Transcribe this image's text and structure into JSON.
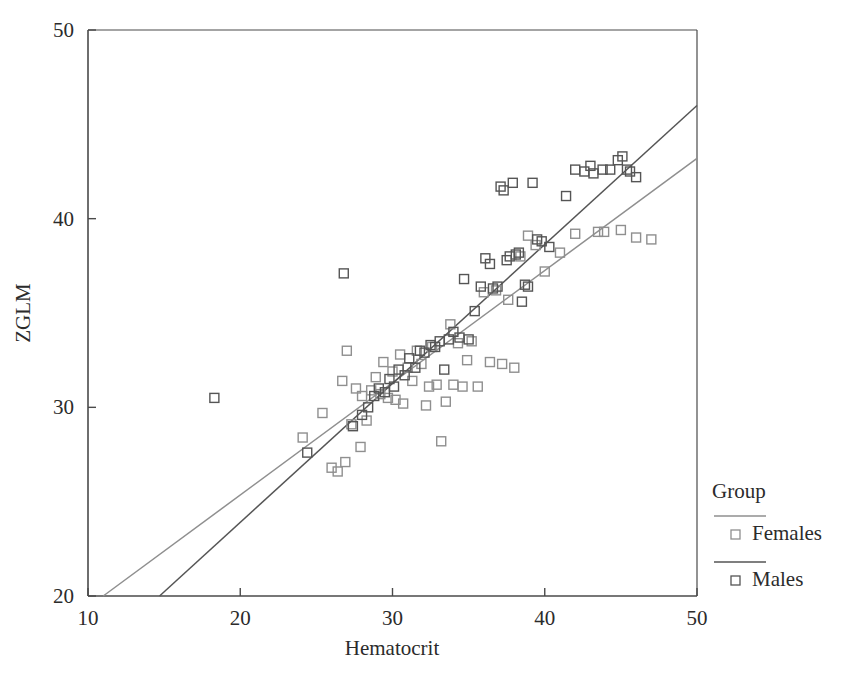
{
  "chart_data": {
    "type": "scatter",
    "title": "",
    "xlabel": "Hematocrit",
    "ylabel": "ZGLM",
    "xlim": [
      10,
      50
    ],
    "ylim": [
      20,
      50
    ],
    "xticks": [
      10,
      20,
      30,
      40,
      50
    ],
    "yticks": [
      20,
      30,
      40,
      50
    ],
    "grid": false,
    "legend": {
      "title": "Group",
      "position": "right-bottom",
      "entries": [
        {
          "name": "Females",
          "color": "#8f8f8f",
          "marker": "open-square",
          "line": "solid"
        },
        {
          "name": "Males",
          "color": "#555555",
          "marker": "open-square",
          "line": "solid"
        }
      ]
    },
    "series": [
      {
        "name": "Females",
        "color": "#8f8f8f",
        "marker": "open-square",
        "fit_line": {
          "x": [
            11.0,
            50.0
          ],
          "y": [
            20.0,
            43.2
          ]
        },
        "points": [
          [
            24.1,
            28.4
          ],
          [
            25.4,
            29.7
          ],
          [
            26.0,
            26.8
          ],
          [
            26.4,
            26.6
          ],
          [
            26.7,
            31.4
          ],
          [
            26.9,
            27.1
          ],
          [
            27.0,
            33.0
          ],
          [
            27.3,
            29.1
          ],
          [
            27.6,
            31.0
          ],
          [
            27.9,
            27.9
          ],
          [
            28.0,
            30.6
          ],
          [
            28.3,
            29.3
          ],
          [
            28.6,
            30.9
          ],
          [
            28.9,
            31.6
          ],
          [
            29.2,
            30.7
          ],
          [
            29.4,
            32.4
          ],
          [
            29.7,
            30.5
          ],
          [
            30.0,
            31.9
          ],
          [
            30.2,
            30.4
          ],
          [
            30.5,
            32.8
          ],
          [
            30.7,
            30.2
          ],
          [
            31.0,
            32.1
          ],
          [
            31.3,
            31.4
          ],
          [
            31.6,
            33.0
          ],
          [
            31.9,
            32.3
          ],
          [
            32.2,
            30.1
          ],
          [
            32.4,
            31.1
          ],
          [
            32.6,
            33.2
          ],
          [
            32.9,
            31.2
          ],
          [
            33.2,
            28.2
          ],
          [
            33.5,
            30.3
          ],
          [
            33.8,
            34.4
          ],
          [
            34.0,
            31.2
          ],
          [
            34.3,
            33.4
          ],
          [
            34.6,
            31.1
          ],
          [
            34.9,
            32.5
          ],
          [
            35.2,
            33.5
          ],
          [
            35.6,
            31.1
          ],
          [
            36.0,
            36.1
          ],
          [
            36.4,
            32.4
          ],
          [
            36.8,
            36.2
          ],
          [
            37.2,
            32.3
          ],
          [
            37.6,
            35.7
          ],
          [
            38.0,
            32.1
          ],
          [
            38.4,
            38.0
          ],
          [
            38.9,
            39.1
          ],
          [
            39.4,
            38.6
          ],
          [
            40.0,
            37.2
          ],
          [
            41.0,
            38.2
          ],
          [
            42.0,
            39.2
          ],
          [
            43.5,
            39.3
          ],
          [
            43.9,
            39.3
          ],
          [
            45.0,
            39.4
          ],
          [
            46.0,
            39.0
          ],
          [
            47.0,
            38.9
          ]
        ]
      },
      {
        "name": "Males",
        "color": "#555555",
        "marker": "open-square",
        "fit_line": {
          "x": [
            14.7,
            50.0
          ],
          "y": [
            20.0,
            46.0
          ]
        },
        "points": [
          [
            18.3,
            30.5
          ],
          [
            24.4,
            27.6
          ],
          [
            26.8,
            37.1
          ],
          [
            27.4,
            29.0
          ],
          [
            28.0,
            29.6
          ],
          [
            28.4,
            30.0
          ],
          [
            28.8,
            30.6
          ],
          [
            29.1,
            31.0
          ],
          [
            29.5,
            30.8
          ],
          [
            29.8,
            31.5
          ],
          [
            30.1,
            31.1
          ],
          [
            30.4,
            32.0
          ],
          [
            30.8,
            31.7
          ],
          [
            31.1,
            32.6
          ],
          [
            31.5,
            32.1
          ],
          [
            31.8,
            33.0
          ],
          [
            32.1,
            32.9
          ],
          [
            32.5,
            33.3
          ],
          [
            32.8,
            33.2
          ],
          [
            33.1,
            33.5
          ],
          [
            33.4,
            32.0
          ],
          [
            33.7,
            33.6
          ],
          [
            34.0,
            34.0
          ],
          [
            34.4,
            33.7
          ],
          [
            34.7,
            36.8
          ],
          [
            35.0,
            33.6
          ],
          [
            35.4,
            35.1
          ],
          [
            35.8,
            36.4
          ],
          [
            36.1,
            37.9
          ],
          [
            36.4,
            37.6
          ],
          [
            36.6,
            36.3
          ],
          [
            36.9,
            36.4
          ],
          [
            37.1,
            41.7
          ],
          [
            37.3,
            41.5
          ],
          [
            37.5,
            37.8
          ],
          [
            37.7,
            38.0
          ],
          [
            37.9,
            41.9
          ],
          [
            38.1,
            38.1
          ],
          [
            38.3,
            38.2
          ],
          [
            38.5,
            35.6
          ],
          [
            38.7,
            36.5
          ],
          [
            38.9,
            36.4
          ],
          [
            39.2,
            41.9
          ],
          [
            39.5,
            38.9
          ],
          [
            39.8,
            38.8
          ],
          [
            40.3,
            38.5
          ],
          [
            41.4,
            41.2
          ],
          [
            42.0,
            42.6
          ],
          [
            42.6,
            42.5
          ],
          [
            43.0,
            42.8
          ],
          [
            43.2,
            42.4
          ],
          [
            43.8,
            42.6
          ],
          [
            44.3,
            42.6
          ],
          [
            44.8,
            43.1
          ],
          [
            45.1,
            43.3
          ],
          [
            45.4,
            42.6
          ],
          [
            45.6,
            42.5
          ],
          [
            46.0,
            42.2
          ]
        ]
      }
    ]
  },
  "axes": {
    "x_tick_labels": [
      "10",
      "20",
      "30",
      "40",
      "50"
    ],
    "y_tick_labels": [
      "20",
      "30",
      "40",
      "50"
    ],
    "x_title": "Hematocrit",
    "y_title": "ZGLM"
  },
  "legend": {
    "title": "Group",
    "items": [
      {
        "label": "Females"
      },
      {
        "label": "Males"
      }
    ]
  },
  "colors": {
    "females": "#8f8f8f",
    "males": "#555555",
    "axis": "#4a4a4a",
    "text": "#2b2b2b",
    "background": "#ffffff"
  }
}
